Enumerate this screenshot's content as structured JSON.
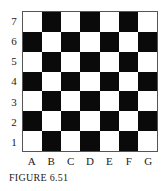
{
  "diagram": {
    "type": "checkerboard-grid",
    "rows": 7,
    "cols": 7,
    "row_labels": [
      "7",
      "6",
      "5",
      "4",
      "3",
      "2",
      "1"
    ],
    "col_labels": [
      "A",
      "B",
      "C",
      "D",
      "E",
      "F",
      "G"
    ],
    "cells": [
      [
        "white",
        "black",
        "white",
        "black",
        "white",
        "black",
        "white"
      ],
      [
        "black",
        "white",
        "black",
        "white",
        "black",
        "white",
        "black"
      ],
      [
        "white",
        "black",
        "white",
        "black",
        "white",
        "black",
        "white"
      ],
      [
        "black",
        "white",
        "black",
        "white",
        "black",
        "white",
        "black"
      ],
      [
        "white",
        "black",
        "white",
        "black",
        "white",
        "black",
        "white"
      ],
      [
        "black",
        "white",
        "black",
        "white",
        "black",
        "white",
        "black"
      ],
      [
        "white",
        "black",
        "white",
        "black",
        "white",
        "black",
        "white"
      ]
    ],
    "colors": {
      "black": "#0a0a0a",
      "white": "#ffffff"
    }
  },
  "caption": "FIGURE 6.51"
}
